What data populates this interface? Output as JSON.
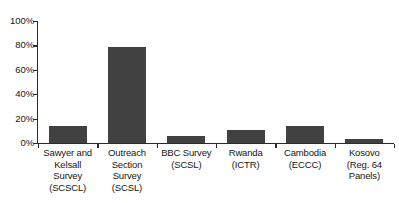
{
  "chart_data": {
    "type": "bar",
    "title": "",
    "subtitle": "",
    "xlabel": "",
    "ylabel": "",
    "ylim": [
      0,
      100
    ],
    "y_ticks": [
      "0%",
      "20%",
      "40%",
      "60%",
      "80%",
      "100%"
    ],
    "y_tick_values": [
      0,
      20,
      40,
      60,
      80,
      100
    ],
    "grid": false,
    "legend": null,
    "bar_color": "#414141",
    "axis_color": "#2b2b2b",
    "categories": [
      "Sawyer and Kelsall Survey (SCSCL)",
      "Outreach Section Survey (SCSL)",
      "BBC Survey (SCSL)",
      "Rwanda (ICTR)",
      "Cambodia (ECCC)",
      "Kosovo (Reg. 64 Panels)"
    ],
    "category_lines": [
      [
        "Sawyer and",
        "Kelsall",
        "Survey",
        "(SCSCL)"
      ],
      [
        "Outreach",
        "Section",
        "Survey",
        "(SCSL)"
      ],
      [
        "BBC Survey",
        "(SCSL)"
      ],
      [
        "Rwanda",
        "(ICTR)"
      ],
      [
        "Cambodia",
        "(ECCC)"
      ],
      [
        "Kosovo",
        "(Reg. 64",
        "Panels)"
      ]
    ],
    "values": [
      14,
      79,
      6,
      11,
      14,
      3
    ]
  }
}
